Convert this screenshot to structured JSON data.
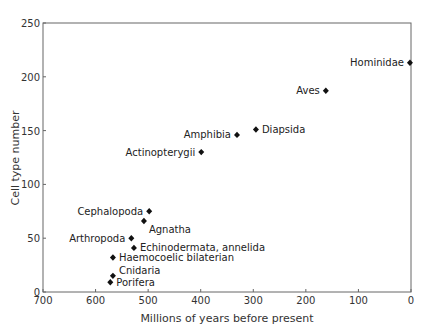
{
  "chart_data": {
    "type": "scatter",
    "title": "",
    "xlabel": "Millions of years before present",
    "ylabel": "Cell type number",
    "xlim": [
      700,
      0
    ],
    "ylim": [
      0,
      250
    ],
    "x_reversed": true,
    "xticks": [
      700,
      600,
      500,
      400,
      300,
      200,
      100,
      0
    ],
    "yticks": [
      0,
      50,
      100,
      150,
      200,
      250
    ],
    "grid": false,
    "legend": null,
    "marker": "diamond",
    "points": [
      {
        "label": "Hominidae",
        "x": 2,
        "y": 213,
        "label_pos": "left"
      },
      {
        "label": "Aves",
        "x": 162,
        "y": 187,
        "label_pos": "left"
      },
      {
        "label": "Diapsida",
        "x": 295,
        "y": 151,
        "label_pos": "right"
      },
      {
        "label": "Amphibia",
        "x": 331,
        "y": 146,
        "label_pos": "left"
      },
      {
        "label": "Actinopterygii",
        "x": 399,
        "y": 130,
        "label_pos": "left"
      },
      {
        "label": "Cephalopoda",
        "x": 498,
        "y": 75,
        "label_pos": "left"
      },
      {
        "label": "Agnatha",
        "x": 508,
        "y": 66,
        "label_pos": "below-right"
      },
      {
        "label": "Arthropoda",
        "x": 532,
        "y": 50,
        "label_pos": "left"
      },
      {
        "label": "Echinodermata, annelida",
        "x": 527,
        "y": 41,
        "label_pos": "right"
      },
      {
        "label": "Haemocoelic bilaterian",
        "x": 567,
        "y": 32,
        "label_pos": "right"
      },
      {
        "label": "Cnidaria",
        "x": 567,
        "y": 15,
        "label_pos": "above-right"
      },
      {
        "label": "Porifera",
        "x": 572,
        "y": 9,
        "label_pos": "right"
      }
    ]
  },
  "colors": {
    "axis": "#555555",
    "marker": "#111111",
    "text": "#333333"
  }
}
